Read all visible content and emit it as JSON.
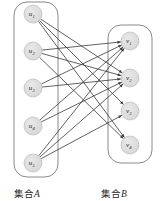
{
  "figure": {
    "type": "bipartite-graph",
    "background_color": "#ffffff",
    "edge_color": "#3a3a3a",
    "node_fill": "#d6d6d6",
    "node_stroke": "#b0b0b0",
    "container_stroke": "#8a8a8a"
  },
  "captions": {
    "set_a": "集合",
    "set_a_tag": "A",
    "set_b": "集合",
    "set_b_tag": "B"
  },
  "set_a": {
    "name": "集合A",
    "nodes": [
      {
        "id": "u1",
        "base": "u",
        "sub": "1",
        "cx": 33,
        "cy": 14,
        "r": 9
      },
      {
        "id": "u2",
        "base": "u",
        "sub": "2",
        "cx": 33,
        "cy": 51,
        "r": 9
      },
      {
        "id": "u3",
        "base": "u",
        "sub": "3",
        "cx": 33,
        "cy": 88,
        "r": 9
      },
      {
        "id": "u4",
        "base": "u",
        "sub": "4",
        "cx": 33,
        "cy": 126,
        "r": 9
      },
      {
        "id": "u5",
        "base": "u",
        "sub": "5",
        "cx": 33,
        "cy": 163,
        "r": 9
      }
    ],
    "container": {
      "x": 14,
      "y": 2,
      "width": 44,
      "height": 175,
      "rx": 13
    }
  },
  "set_b": {
    "name": "集合B",
    "nodes": [
      {
        "id": "v1",
        "base": "v",
        "sub": "1",
        "cx": 130,
        "cy": 41,
        "r": 9
      },
      {
        "id": "v2",
        "base": "v",
        "sub": "2",
        "cx": 130,
        "cy": 78,
        "r": 9
      },
      {
        "id": "v3",
        "base": "v",
        "sub": "3",
        "cx": 130,
        "cy": 111,
        "r": 9
      },
      {
        "id": "v4",
        "base": "v",
        "sub": "4",
        "cx": 130,
        "cy": 145,
        "r": 9
      }
    ],
    "container": {
      "x": 108,
      "y": 25,
      "width": 44,
      "height": 138,
      "rx": 13
    }
  },
  "edges": [
    {
      "from": "u1",
      "to": "v2"
    },
    {
      "from": "u1",
      "to": "v3"
    },
    {
      "from": "u1",
      "to": "v4"
    },
    {
      "from": "u2",
      "to": "v1"
    },
    {
      "from": "u2",
      "to": "v2"
    },
    {
      "from": "u2",
      "to": "v4"
    },
    {
      "from": "u3",
      "to": "v1"
    },
    {
      "from": "u3",
      "to": "v2"
    },
    {
      "from": "u4",
      "to": "v1"
    },
    {
      "from": "u4",
      "to": "v2"
    },
    {
      "from": "u5",
      "to": "v1"
    },
    {
      "from": "u5",
      "to": "v2"
    },
    {
      "from": "u5",
      "to": "v3"
    }
  ]
}
